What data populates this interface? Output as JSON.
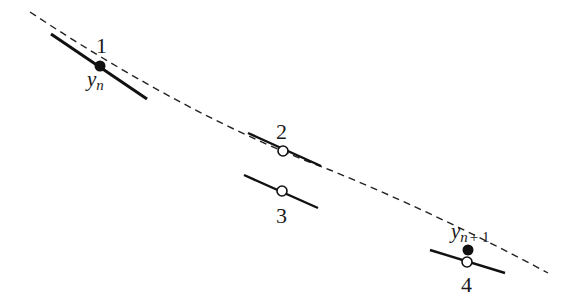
{
  "diagram": {
    "type": "numerical-integration-step",
    "curve": {
      "style": "dashed",
      "color": "#222222"
    },
    "points": [
      {
        "id": "1",
        "label": "1",
        "marker": "filled",
        "var_label": "y",
        "var_sub": "n"
      },
      {
        "id": "2",
        "label": "2",
        "marker": "hollow"
      },
      {
        "id": "3",
        "label": "3",
        "marker": "hollow"
      },
      {
        "id": "4",
        "label": "4",
        "marker": "hollow"
      }
    ],
    "next_point": {
      "marker": "filled",
      "var_label": "y",
      "var_sub": "n",
      "var_sub_plus": "+ 1"
    }
  }
}
